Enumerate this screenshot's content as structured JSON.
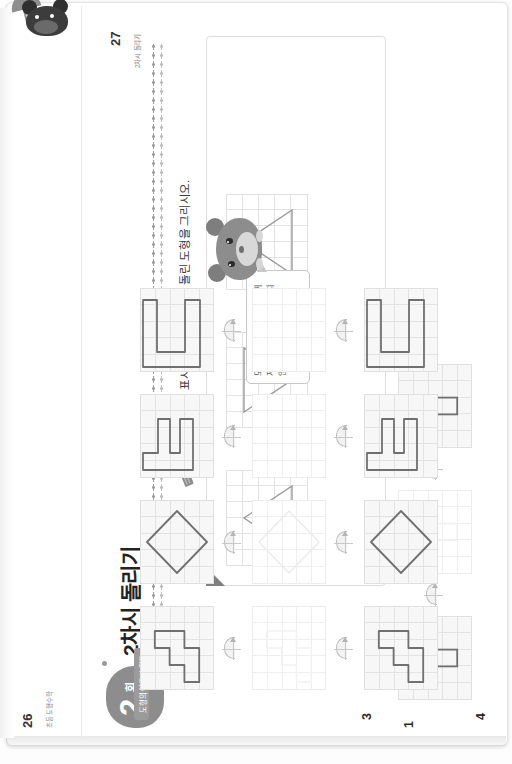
{
  "book": {
    "chapter_badge_number": "2",
    "chapter_badge_unit": "회",
    "chapter_title": "2차시 돌리기",
    "lesson_instruction": "주어진 도형을 표시된 방향으로 각각 돌린 도형을 그리시오.",
    "tab_label": "도형의 이동과 합동",
    "balloon_text": "도형을 돌리면 방향은 바뀌지만 모양과 크기는 변하지 않아요!",
    "left_page": {
      "folio": "26",
      "folio_note": "초등 도형수학"
    },
    "right_page": {
      "folio": "27",
      "folio_note": "2차시 돌리기"
    }
  },
  "icons": {
    "rotate": "rotate-icon",
    "pencil": "pencil-icon",
    "hamster": "hamster-character-icon",
    "rat": "rat-character-icon"
  },
  "colors": {
    "paper": "#ffffff",
    "grid_line": "#e3e3e3",
    "shape_stroke": "#707070",
    "shape_stroke_faint": "#dcdcdc",
    "badge": "#8d8d8d",
    "tab": "#9b9b9b",
    "text": "#222222"
  },
  "problems": [
    {
      "number": "1",
      "page": "26",
      "shape_name": "vertical-rectangle",
      "rows": [
        {
          "state": "given",
          "filled": true
        },
        {
          "state": "answer",
          "filled": false
        },
        {
          "state": "given",
          "filled": true
        }
      ]
    },
    {
      "number": "2",
      "page": "26",
      "shape_name": "pentagon-home-plate",
      "rows": [
        {
          "state": "given",
          "filled": true
        },
        {
          "state": "answer",
          "filled": false
        },
        {
          "state": "given",
          "filled": true
        }
      ]
    },
    {
      "number": "3",
      "page": "27",
      "shape_name": "staircase",
      "rows": [
        {
          "state": "given",
          "filled": true
        },
        {
          "state": "answer",
          "filled": false
        },
        {
          "state": "given",
          "filled": true
        }
      ]
    },
    {
      "number": "4",
      "page": "27",
      "shape_name": "diamond",
      "rows": [
        {
          "state": "given",
          "filled": true
        },
        {
          "state": "answer",
          "filled": false
        },
        {
          "state": "given",
          "filled": true
        }
      ]
    },
    {
      "number": "5",
      "page": "27",
      "shape_name": "e-block",
      "rows": [
        {
          "state": "given",
          "filled": true
        },
        {
          "state": "answer",
          "filled": false
        },
        {
          "state": "given",
          "filled": true
        }
      ]
    },
    {
      "number": "6",
      "page": "27",
      "shape_name": "c-block",
      "rows": [
        {
          "state": "given",
          "filled": true
        },
        {
          "state": "answer",
          "filled": false
        },
        {
          "state": "given",
          "filled": true
        }
      ]
    }
  ],
  "example": {
    "page": "26",
    "shape_name": "triangle",
    "rows": [
      {
        "state": "given",
        "filled": true
      },
      {
        "state": "given",
        "filled": true
      },
      {
        "state": "given",
        "filled": true
      }
    ]
  }
}
